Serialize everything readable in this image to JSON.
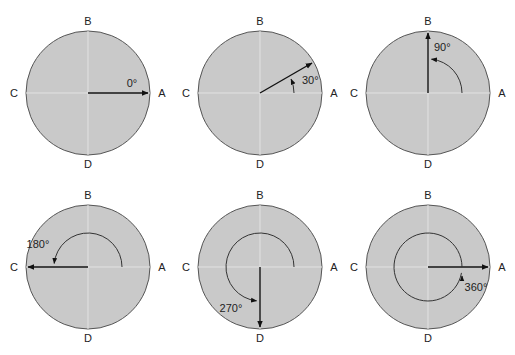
{
  "colors": {
    "disc_fill": "#c9c9c9",
    "disc_stroke": "#555555",
    "axis_line": "#e2e2e2",
    "arrow": "#111111"
  },
  "point_labels": {
    "right": "A",
    "top": "B",
    "left": "C",
    "bottom": "D"
  },
  "diagrams": [
    {
      "angle_deg": 0,
      "label": "0°"
    },
    {
      "angle_deg": 30,
      "label": "30°"
    },
    {
      "angle_deg": 90,
      "label": "90°"
    },
    {
      "angle_deg": 180,
      "label": "180°"
    },
    {
      "angle_deg": 270,
      "label": "270°"
    },
    {
      "angle_deg": 360,
      "label": "360°"
    }
  ]
}
